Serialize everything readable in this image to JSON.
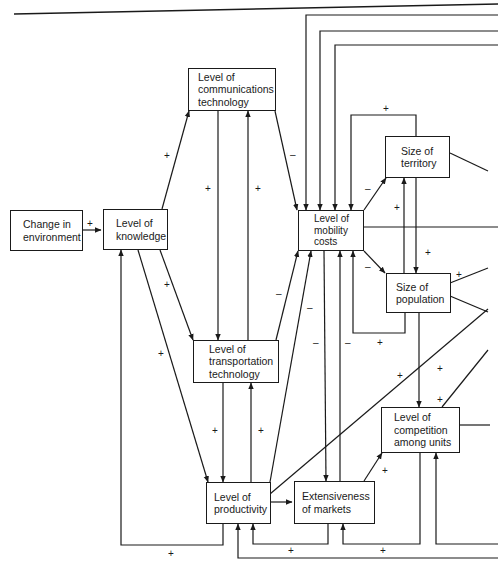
{
  "nodes": {
    "change_env": {
      "lines": [
        "Change in",
        "environment"
      ]
    },
    "knowledge": {
      "lines": [
        "Level of",
        "knowledge"
      ]
    },
    "comm_tech": {
      "lines": [
        "Level of",
        "communications",
        "technology"
      ]
    },
    "transport_tech": {
      "lines": [
        "Level of",
        "transportation",
        "technology"
      ]
    },
    "productivity": {
      "lines": [
        "Level of",
        "productivity"
      ]
    },
    "markets": {
      "lines": [
        "Extensiveness",
        "of markets"
      ]
    },
    "mobility": {
      "lines": [
        "Level of",
        "mobility",
        "costs"
      ]
    },
    "territory": {
      "lines": [
        "Size of",
        "territory"
      ]
    },
    "population": {
      "lines": [
        "Size of",
        "population"
      ]
    },
    "competition": {
      "lines": [
        "Level of",
        "competition",
        "among units"
      ]
    }
  },
  "signs": {
    "env_knowledge": "+",
    "knowledge_comm": "+",
    "comm_transport": "+",
    "transport_comm": "+",
    "comm_mobility": "–",
    "knowledge_transport": "+",
    "knowledge_productivity": "+",
    "transport_mobility": "–",
    "transport_productivity": "+",
    "productivity_transport": "+",
    "mobility_prod_1": "–",
    "mobility_prod_2": "–",
    "mobility_markets": "–",
    "mobility_territory": "–",
    "mobility_population": "–",
    "territory_loop": "+",
    "territory_population": "+",
    "population_territory": "+",
    "population_loop": "+",
    "population_right": "+",
    "population_competition": "+",
    "right_competition": "+",
    "markets_competition": "+",
    "productivity_knowledge": "+",
    "markets_productivity": "+",
    "competition_markets": "+"
  }
}
